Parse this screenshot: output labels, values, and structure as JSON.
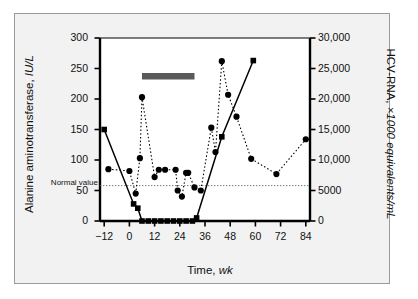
{
  "figure": {
    "background": "#f2f2f2",
    "plot_background": "#ffffff",
    "frame_color": "#9a9a9a"
  },
  "annotations": {
    "interferon_label": "Interferon treatment",
    "interferon_bar": {
      "start_week": 6,
      "end_week": 31,
      "color": "#5a5a5a"
    },
    "normal_value_label": "Normal value",
    "normal_value_alt": 58
  },
  "chart_data": {
    "type": "line",
    "title": "",
    "xlabel": "Time, wk",
    "xlabel_plain": "Time,",
    "xlabel_italic": "wk",
    "xlim": [
      -14,
      86
    ],
    "xticks": [
      -12,
      0,
      12,
      24,
      36,
      48,
      60,
      72,
      84
    ],
    "xticklabels": [
      "−12",
      "0",
      "12",
      "24",
      "36",
      "48",
      "60",
      "72",
      "84"
    ],
    "grid": false,
    "legend": "none",
    "axes": [
      {
        "side": "left",
        "label_plain": "Alanine aminotransferase,",
        "label_italic": "IU/L",
        "ylim": [
          0,
          300
        ],
        "yticks": [
          0,
          50,
          100,
          150,
          200,
          250,
          300
        ],
        "yticklabels": [
          "0",
          "50",
          "100",
          "150",
          "200",
          "250",
          "300"
        ]
      },
      {
        "side": "right",
        "label_plain": "HCV-RNA,",
        "label_italic": "×1000 equivalents/mL",
        "ylim": [
          0,
          30000
        ],
        "yticks": [
          0,
          5000,
          10000,
          15000,
          20000,
          25000,
          30000
        ],
        "yticklabels": [
          "0",
          "5000",
          "10,000",
          "15,000",
          "20,000",
          "25,000",
          "30,000"
        ]
      }
    ],
    "series": [
      {
        "name": "Alanine aminotransferase",
        "axis": "left",
        "marker": "circle",
        "linestyle": "dotted",
        "color": "#000000",
        "x": [
          -10,
          0,
          3,
          5,
          6,
          12,
          14,
          17,
          22,
          23,
          25,
          27,
          28,
          31,
          34,
          39,
          41,
          44,
          47,
          51,
          58,
          70,
          84
        ],
        "values": [
          85,
          82,
          45,
          103,
          203,
          72,
          84,
          84,
          84,
          50,
          40,
          79,
          79,
          55,
          50,
          153,
          113,
          262,
          207,
          171,
          102,
          77,
          134
        ]
      },
      {
        "name": "HCV-RNA",
        "axis": "right",
        "marker": "square",
        "linestyle": "solid",
        "color": "#000000",
        "x": [
          -12,
          2,
          4,
          6,
          9,
          12,
          15,
          18,
          21,
          24,
          27,
          30,
          32,
          44,
          59
        ],
        "values": [
          15000,
          2800,
          2100,
          0,
          0,
          0,
          0,
          0,
          0,
          0,
          0,
          0,
          500,
          13800,
          26300
        ]
      }
    ]
  }
}
